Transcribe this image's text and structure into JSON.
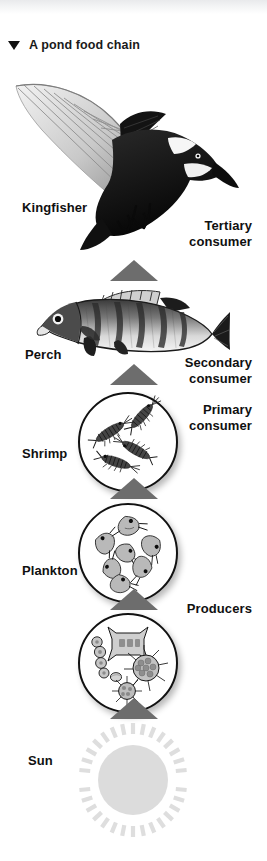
{
  "figure": {
    "caption": "A pond food chain",
    "caption_marker": "down-triangle",
    "background_color": "#ffffff",
    "arrow_color": "#6d6d6d",
    "outline_color": "#111111",
    "sun_color": "#dcdcdc",
    "text_color": "#101010"
  },
  "levels": [
    {
      "id": "kingfisher",
      "organism_label": "Kingfisher",
      "role_label": "Tertiary\nconsumer",
      "illustration": "kingfisher-in-flight"
    },
    {
      "id": "perch",
      "organism_label": "Perch",
      "role_label": "Secondary\nconsumer",
      "illustration": "perch-fish"
    },
    {
      "id": "shrimp",
      "organism_label": "Shrimp",
      "role_label": "Primary\nconsumer",
      "illustration": "shrimp-circle"
    },
    {
      "id": "plankton",
      "organism_label": "Plankton",
      "role_label": "Producers",
      "illustration": "zooplankton-circle"
    },
    {
      "id": "algae",
      "organism_label": "",
      "role_label": "",
      "illustration": "phytoplankton-circle"
    },
    {
      "id": "sun",
      "organism_label": "Sun",
      "role_label": "",
      "illustration": "sun-disc-with-rays"
    }
  ],
  "arrows": {
    "count": 5,
    "direction": "upward",
    "meaning": "energy flows upward through the food chain"
  }
}
